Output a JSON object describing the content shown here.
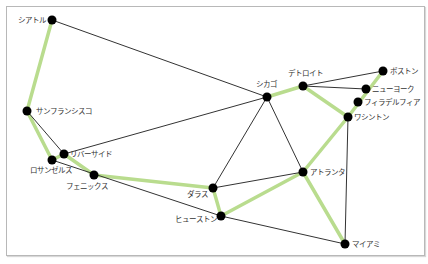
{
  "diagram": {
    "type": "graph-network",
    "highlight_color": "#b9dc8e",
    "edge_color": "#333333",
    "node_color": "#000000",
    "nodes": [
      {
        "id": "seattle",
        "label": "シアトル",
        "x": 52,
        "y": 20,
        "lx": 46,
        "ly": 23,
        "anchor": "end"
      },
      {
        "id": "sanfrancisco",
        "label": "サンフランシスコ",
        "x": 27,
        "y": 111,
        "lx": 36,
        "ly": 114,
        "anchor": "start"
      },
      {
        "id": "riverside",
        "label": "リバーサイド",
        "x": 64,
        "y": 154,
        "lx": 70,
        "ly": 157,
        "anchor": "start"
      },
      {
        "id": "losangeles",
        "label": "ロサンゼルス",
        "x": 52,
        "y": 160,
        "lx": 30,
        "ly": 173,
        "anchor": "start"
      },
      {
        "id": "phoenix",
        "label": "フェニックス",
        "x": 94,
        "y": 175,
        "lx": 66,
        "ly": 189,
        "anchor": "start"
      },
      {
        "id": "dallas",
        "label": "ダラス",
        "x": 213,
        "y": 188,
        "lx": 187,
        "ly": 197,
        "anchor": "start"
      },
      {
        "id": "houston",
        "label": "ヒューストン",
        "x": 221,
        "y": 216,
        "lx": 175,
        "ly": 222,
        "anchor": "start"
      },
      {
        "id": "chicago",
        "label": "シカゴ",
        "x": 267,
        "y": 97,
        "lx": 256,
        "ly": 87,
        "anchor": "start"
      },
      {
        "id": "detroit",
        "label": "デトロイト",
        "x": 303,
        "y": 86,
        "lx": 288,
        "ly": 76,
        "anchor": "start"
      },
      {
        "id": "boston",
        "label": "ボストン",
        "x": 383,
        "y": 71,
        "lx": 390,
        "ly": 74,
        "anchor": "start"
      },
      {
        "id": "newyork",
        "label": "ニューヨーク",
        "x": 366,
        "y": 89,
        "lx": 372,
        "ly": 92,
        "anchor": "start"
      },
      {
        "id": "philadelphia",
        "label": "フィラデルフィア",
        "x": 358,
        "y": 102,
        "lx": 364,
        "ly": 105,
        "anchor": "start"
      },
      {
        "id": "washington",
        "label": "ワシントン",
        "x": 348,
        "y": 117,
        "lx": 354,
        "ly": 120,
        "anchor": "start"
      },
      {
        "id": "atlanta",
        "label": "アトランタ",
        "x": 303,
        "y": 172,
        "lx": 310,
        "ly": 175,
        "anchor": "start"
      },
      {
        "id": "miami",
        "label": "マイアミ",
        "x": 345,
        "y": 244,
        "lx": 352,
        "ly": 247,
        "anchor": "start"
      }
    ],
    "edges": [
      {
        "from": "seattle",
        "to": "chicago",
        "highlight": false
      },
      {
        "from": "sanfrancisco",
        "to": "riverside",
        "highlight": false
      },
      {
        "from": "riverside",
        "to": "chicago",
        "highlight": false
      },
      {
        "from": "losangeles",
        "to": "houston",
        "highlight": false
      },
      {
        "from": "chicago",
        "to": "dallas",
        "highlight": false
      },
      {
        "from": "chicago",
        "to": "atlanta",
        "highlight": false
      },
      {
        "from": "dallas",
        "to": "atlanta",
        "highlight": false
      },
      {
        "from": "houston",
        "to": "miami",
        "highlight": false
      },
      {
        "from": "detroit",
        "to": "boston",
        "highlight": false
      },
      {
        "from": "detroit",
        "to": "newyork",
        "highlight": false
      },
      {
        "from": "washington",
        "to": "miami",
        "highlight": false
      },
      {
        "from": "seattle",
        "to": "sanfrancisco",
        "highlight": true
      },
      {
        "from": "sanfrancisco",
        "to": "losangeles",
        "highlight": true
      },
      {
        "from": "losangeles",
        "to": "riverside",
        "highlight": true
      },
      {
        "from": "riverside",
        "to": "phoenix",
        "highlight": true
      },
      {
        "from": "phoenix",
        "to": "dallas",
        "highlight": true
      },
      {
        "from": "dallas",
        "to": "houston",
        "highlight": true
      },
      {
        "from": "houston",
        "to": "atlanta",
        "highlight": true
      },
      {
        "from": "atlanta",
        "to": "washington",
        "highlight": true
      },
      {
        "from": "atlanta",
        "to": "miami",
        "highlight": true
      },
      {
        "from": "washington",
        "to": "boston",
        "highlight": true
      },
      {
        "from": "washington",
        "to": "detroit",
        "highlight": true
      },
      {
        "from": "detroit",
        "to": "chicago",
        "highlight": true
      }
    ]
  }
}
